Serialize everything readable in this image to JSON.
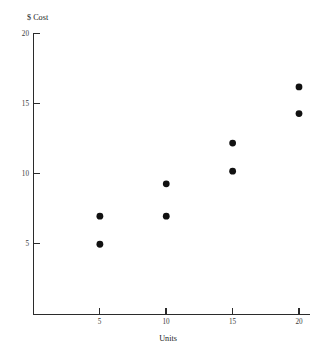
{
  "chart_data": {
    "type": "scatter",
    "title": "",
    "xlabel": "Units",
    "ylabel": "$ Cost",
    "xlim": [
      0,
      21.8
    ],
    "ylim": [
      0,
      20
    ],
    "grid": false,
    "legend": null,
    "xticks": [
      5,
      10,
      15,
      20
    ],
    "xtick_labels": [
      "5",
      "10",
      "15",
      "20"
    ],
    "yticks": [
      5,
      10,
      15,
      20
    ],
    "ytick_labels": [
      "5",
      "10",
      "15",
      "20"
    ],
    "marker": "filled-circle",
    "marker_color": "#111111",
    "points": [
      {
        "x": 5,
        "y": 7.0
      },
      {
        "x": 5,
        "y": 5.0
      },
      {
        "x": 10,
        "y": 9.3
      },
      {
        "x": 10,
        "y": 7.0
      },
      {
        "x": 15,
        "y": 12.2
      },
      {
        "x": 15,
        "y": 10.2
      },
      {
        "x": 20,
        "y": 16.2
      },
      {
        "x": 20,
        "y": 14.3
      }
    ]
  },
  "axes": {
    "y_title": "$ Cost",
    "x_title": "Units",
    "y_tick_labels": [
      "20",
      "15",
      "10",
      "5"
    ],
    "x_tick_labels": [
      "5",
      "10",
      "15",
      "20"
    ]
  }
}
